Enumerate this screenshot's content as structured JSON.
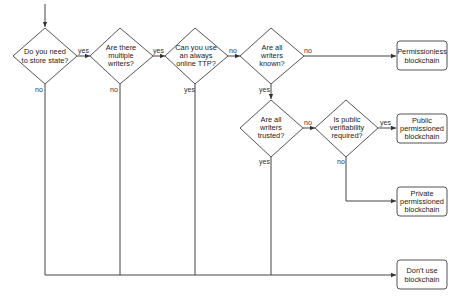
{
  "diagram": {
    "type": "flowchart",
    "title": "",
    "colors": {
      "stroke": "#555555",
      "text": "#222222",
      "background": "#ffffff"
    },
    "decisions": [
      {
        "id": "d1",
        "lines": [
          "Do you need",
          "to store state?"
        ]
      },
      {
        "id": "d2",
        "lines": [
          "Are there",
          "multiple",
          "writers?"
        ]
      },
      {
        "id": "d3",
        "lines": [
          "Can you use",
          "an always",
          "online TTP?"
        ]
      },
      {
        "id": "d4",
        "lines": [
          "Are all",
          "writers",
          "known?"
        ]
      },
      {
        "id": "d5",
        "lines": [
          "Are all",
          "writers",
          "trusted?"
        ]
      },
      {
        "id": "d6",
        "lines": [
          "Is public",
          "verifiability",
          "required?"
        ]
      }
    ],
    "outcomes": [
      {
        "id": "o1",
        "lines": [
          "Permissionless",
          "blockchain"
        ]
      },
      {
        "id": "o2",
        "lines": [
          "Public",
          "permissioned",
          "blockchain"
        ]
      },
      {
        "id": "o3",
        "lines": [
          "Private",
          "permissioned",
          "blockchain"
        ]
      },
      {
        "id": "o4",
        "lines": [
          "Don't use",
          "blockchain"
        ]
      }
    ],
    "edges": [
      {
        "from": "start",
        "to": "d1",
        "label": ""
      },
      {
        "from": "d1",
        "to": "d2",
        "label": "yes"
      },
      {
        "from": "d1",
        "to": "o4",
        "label": "no"
      },
      {
        "from": "d2",
        "to": "d3",
        "label": "yes"
      },
      {
        "from": "d2",
        "to": "o4",
        "label": "no"
      },
      {
        "from": "d3",
        "to": "d4",
        "label": "no"
      },
      {
        "from": "d3",
        "to": "o4",
        "label": "yes"
      },
      {
        "from": "d4",
        "to": "o1",
        "label": "no"
      },
      {
        "from": "d4",
        "to": "d5",
        "label": "yes"
      },
      {
        "from": "d5",
        "to": "d6",
        "label": "no"
      },
      {
        "from": "d5",
        "to": "o4",
        "label": "yes"
      },
      {
        "from": "d6",
        "to": "o2",
        "label": "yes"
      },
      {
        "from": "d6",
        "to": "o3",
        "label": "no"
      }
    ],
    "labels": {
      "yes": "yes",
      "no": "no"
    }
  }
}
